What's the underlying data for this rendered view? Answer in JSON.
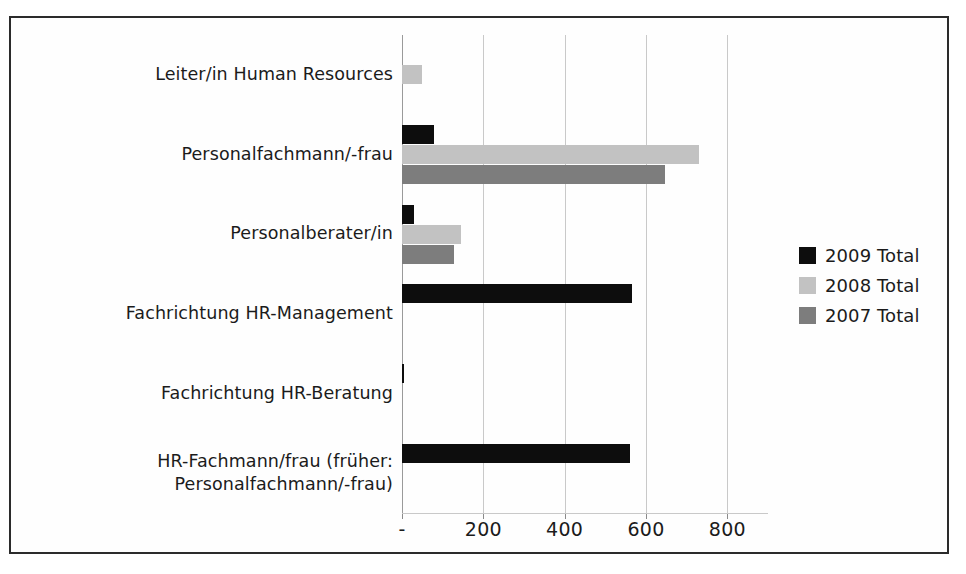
{
  "chart_data": {
    "type": "bar",
    "orientation": "horizontal",
    "title": "",
    "xlabel": "",
    "ylabel": "",
    "xlim": [
      0,
      900
    ],
    "grid": true,
    "legend_position": "right",
    "x_tick_labels": [
      "-",
      "200",
      "400",
      "600",
      "800"
    ],
    "x_tick_values": [
      0,
      200,
      400,
      600,
      800
    ],
    "categories": [
      "Leiter/in Human Resources",
      "Personalfachmann/-frau",
      "Personalberater/in",
      "Fachrichtung HR-Management",
      "Fachrichtung HR-Beratung",
      "HR-Fachmann/frau (früher:\nPersonalfachmann/-frau)"
    ],
    "series": [
      {
        "name": "2009 Total",
        "color": "#0d0d0d",
        "values": [
          0,
          78,
          30,
          565,
          5,
          560
        ]
      },
      {
        "name": "2008 Total",
        "color": "#c2c2c2",
        "values": [
          50,
          730,
          146,
          0,
          0,
          0
        ]
      },
      {
        "name": "2007 Total",
        "color": "#7d7d7d",
        "values": [
          0,
          647,
          129,
          0,
          0,
          0
        ]
      }
    ]
  },
  "legend": {
    "items": [
      {
        "label": "2009 Total",
        "color": "#0d0d0d"
      },
      {
        "label": "2008 Total",
        "color": "#c2c2c2"
      },
      {
        "label": "2007 Total",
        "color": "#7d7d7d"
      }
    ]
  }
}
